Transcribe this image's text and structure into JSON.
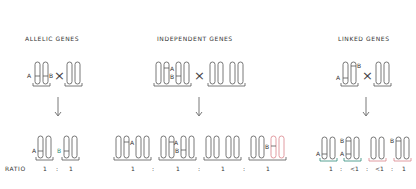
{
  "panels": [
    {
      "id": "allelic",
      "title": "ALLELIC GENES",
      "parent_labels": [
        "A",
        "B"
      ],
      "cross_symbol": "×",
      "offspring_labels": [
        "A",
        "B"
      ],
      "ratio": [
        "1",
        ":",
        "1"
      ]
    },
    {
      "id": "independent",
      "title": "INDEPENDENT GENES",
      "parent_labels": [
        "A",
        "B"
      ],
      "cross_symbol": "×",
      "offspring_labels": [
        "A",
        "A",
        "B",
        "B"
      ],
      "ratio": [
        "1",
        ":",
        "1",
        ":",
        "1",
        ":",
        "1"
      ]
    },
    {
      "id": "linked",
      "title": "LINKED GENES",
      "parent_labels": [
        "A",
        "B"
      ],
      "cross_symbol": "×",
      "offspring_labels": [
        "A",
        "B",
        "A",
        "B"
      ],
      "ratio": [
        "1",
        ":",
        "<1",
        ":",
        "<1",
        ":",
        "1"
      ]
    }
  ],
  "ratio_label": "RATIO",
  "colors": {
    "line": "#555555",
    "teal": "#2e8b7a",
    "pink": "#d9848c",
    "text": "#333333"
  }
}
